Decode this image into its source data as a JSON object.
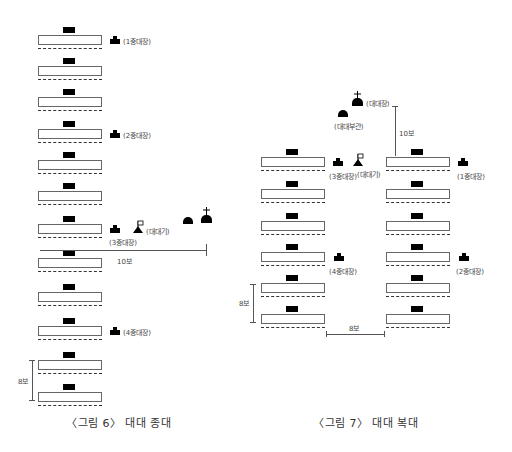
{
  "figure6": {
    "caption": "〈그림 6〉 대대 종대",
    "labels": {
      "co1": "(1중대장)",
      "co2": "(2중대장)",
      "co3": "(3중대장)",
      "co4": "(4중대장)",
      "flag": "(대대기)"
    },
    "dist_10": "10보",
    "dist_8": "8보",
    "rows": 12
  },
  "figure7": {
    "caption": "〈그림 7〉 대대 복대",
    "labels": {
      "bn_cmdr": "(대대장)",
      "bn_xo": "(대대부관)",
      "co1": "(1중대장)",
      "co2": "(2중대장)",
      "co3": "(3중대장)",
      "co4": "(4중대장)",
      "flag": "(대대기)"
    },
    "dist_10": "10보",
    "dist_8_vertical": "8보",
    "dist_8_horizontal": "8보",
    "rows_per_column": 6
  }
}
